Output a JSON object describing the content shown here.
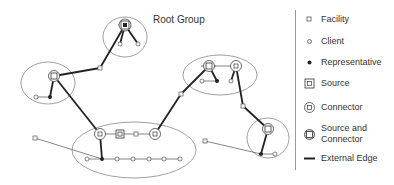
{
  "diagram": {
    "root_group_label": "Root Group",
    "colors": {
      "line": "#555555",
      "thick_edge": "#222222",
      "ellipse": "#888888",
      "text": "#333333"
    }
  },
  "legend": {
    "items": [
      {
        "icon": "facility-icon",
        "label": "Facility"
      },
      {
        "icon": "client-icon",
        "label": "Client"
      },
      {
        "icon": "representative-icon",
        "label": "Representative"
      },
      {
        "icon": "source-icon",
        "label": "Source"
      },
      {
        "icon": "connector-icon",
        "label": "Connector"
      },
      {
        "icon": "source-and-connector-icon",
        "label": "Source and\nConnector"
      },
      {
        "icon": "external-edge-icon",
        "label": "External Edge"
      }
    ]
  }
}
